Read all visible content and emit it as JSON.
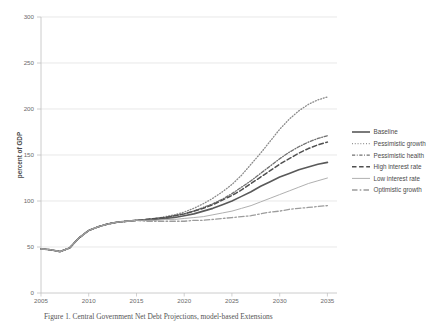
{
  "chart_data": {
    "type": "line",
    "title": "",
    "subtitle": "",
    "xlabel": "",
    "ylabel": "percent of GDP",
    "xlim": [
      2005,
      2036
    ],
    "ylim": [
      0,
      300
    ],
    "grid": true,
    "legend_position": "right",
    "x_ticks": [
      "2005",
      "2010",
      "2015",
      "2020",
      "2025",
      "2030",
      "2035"
    ],
    "y_ticks": [
      "0",
      "50",
      "100",
      "150",
      "200",
      "250",
      "300"
    ],
    "x": [
      2005,
      2006,
      2007,
      2008,
      2009,
      2010,
      2011,
      2012,
      2013,
      2014,
      2015,
      2016,
      2017,
      2018,
      2019,
      2020,
      2021,
      2022,
      2023,
      2024,
      2025,
      2026,
      2027,
      2028,
      2029,
      2030,
      2031,
      2032,
      2033,
      2034,
      2035
    ],
    "series": [
      {
        "name": "Baseline",
        "style": "solid",
        "color": "#595959",
        "width": 1.6,
        "values": [
          48,
          47,
          45,
          49,
          60,
          68,
          72,
          75,
          77,
          78,
          79,
          79,
          80,
          81,
          82,
          84,
          86,
          89,
          92,
          96,
          100,
          105,
          110,
          116,
          121,
          126,
          130,
          134,
          137,
          140,
          142
        ]
      },
      {
        "name": "Pessimistic growth",
        "style": "dotted",
        "color": "#8a8a8a",
        "width": 1.3,
        "values": [
          48,
          47,
          45,
          49,
          60,
          68,
          72,
          75,
          77,
          78,
          79,
          80,
          81,
          83,
          85,
          88,
          92,
          97,
          103,
          110,
          118,
          128,
          140,
          152,
          165,
          178,
          189,
          198,
          205,
          210,
          213
        ]
      },
      {
        "name": "Pessimistic health",
        "style": "dashdot",
        "color": "#707070",
        "width": 1.3,
        "values": [
          48,
          47,
          45,
          49,
          60,
          68,
          72,
          75,
          77,
          78,
          79,
          80,
          81,
          82,
          84,
          86,
          89,
          93,
          97,
          102,
          108,
          115,
          122,
          130,
          138,
          146,
          153,
          159,
          164,
          168,
          171
        ]
      },
      {
        "name": "High interest rate",
        "style": "dashed",
        "color": "#4f4f4f",
        "width": 1.5,
        "values": [
          48,
          47,
          45,
          49,
          60,
          68,
          72,
          75,
          77,
          78,
          79,
          80,
          81,
          82,
          84,
          86,
          89,
          92,
          96,
          101,
          106,
          112,
          119,
          126,
          133,
          140,
          146,
          152,
          157,
          161,
          164
        ]
      },
      {
        "name": "Low interest rate",
        "style": "solid-thin",
        "color": "#b0b0b0",
        "width": 1.0,
        "values": [
          48,
          47,
          45,
          49,
          60,
          68,
          72,
          75,
          77,
          78,
          79,
          79,
          79,
          80,
          80,
          81,
          82,
          83,
          85,
          87,
          89,
          92,
          95,
          99,
          103,
          107,
          111,
          115,
          119,
          122,
          125
        ]
      },
      {
        "name": "Optimistic growth",
        "style": "longdash",
        "color": "#9c9c9c",
        "width": 1.3,
        "values": [
          48,
          47,
          45,
          49,
          60,
          68,
          72,
          75,
          77,
          78,
          79,
          78,
          78,
          78,
          78,
          78,
          79,
          79,
          80,
          81,
          82,
          83,
          84,
          86,
          88,
          89,
          91,
          92,
          93,
          94,
          95
        ]
      }
    ]
  },
  "legend": {
    "items": [
      {
        "label": "Baseline"
      },
      {
        "label": "Pessimistic growth"
      },
      {
        "label": "Pessimistic health"
      },
      {
        "label": "High interest rate"
      },
      {
        "label": "Low interest rate"
      },
      {
        "label": "Optimistic growth"
      }
    ]
  },
  "caption": {
    "text": "Figure 1. Central Government Net Debt Projections, model-based Extensions"
  },
  "colors": {
    "grid": "#d9d9d9",
    "axis": "#bfbfbf",
    "text": "#4a4a4a",
    "background": "#ffffff"
  }
}
